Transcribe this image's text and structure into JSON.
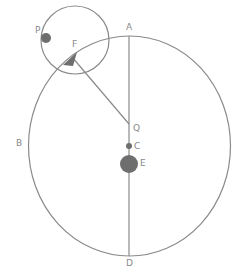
{
  "diagram": {
    "colors": {
      "stroke": "#8a8a8a",
      "fill": "#6e6e6e",
      "label": "#888888",
      "background": "#ffffff"
    },
    "labels": {
      "A": "A",
      "B": "B",
      "C": "C",
      "D": "D",
      "E": "E",
      "F": "F",
      "P": "P",
      "Q": "Q"
    },
    "shapes": {
      "large_ellipse": {
        "cx": 129.5,
        "cy": 146,
        "rx": 101,
        "ry": 110
      },
      "small_circle": {
        "cx": 75,
        "cy": 40,
        "r": 34
      },
      "vertical_axis": {
        "x": 129,
        "y1": 36,
        "y2": 256
      },
      "line_F_Q": {
        "x1": 72,
        "y1": 56,
        "x2": 129,
        "y2": 124
      },
      "point_P": {
        "cx": 46,
        "cy": 38,
        "r": 5
      },
      "point_C": {
        "cx": 129,
        "cy": 146,
        "r": 3
      },
      "point_E": {
        "cx": 129,
        "cy": 164,
        "r": 9
      },
      "arrow_F": {
        "points": "64,64 76,52 74,64"
      }
    }
  }
}
